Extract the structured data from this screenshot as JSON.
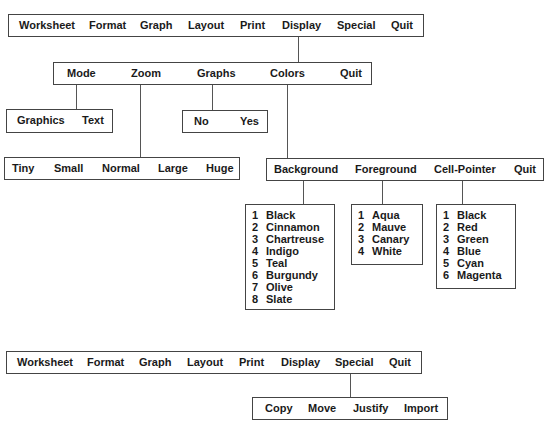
{
  "menus": {
    "main_top": {
      "items": [
        "Worksheet",
        "Format",
        "Graph",
        "Layout",
        "Print",
        "Display",
        "Special",
        "Quit"
      ]
    },
    "display": {
      "items": [
        "Mode",
        "Zoom",
        "Graphs",
        "Colors",
        "Quit"
      ]
    },
    "mode": {
      "items": [
        "Graphics",
        "Text"
      ]
    },
    "graphs": {
      "items": [
        "No",
        "Yes"
      ]
    },
    "zoom": {
      "items": [
        "Tiny",
        "Small",
        "Normal",
        "Large",
        "Huge"
      ]
    },
    "colors": {
      "items": [
        "Background",
        "Foreground",
        "Cell-Pointer",
        "Quit"
      ]
    },
    "background": {
      "items": [
        {
          "num": "1",
          "label": "Black"
        },
        {
          "num": "2",
          "label": "Cinnamon"
        },
        {
          "num": "3",
          "label": "Chartreuse"
        },
        {
          "num": "4",
          "label": "Indigo"
        },
        {
          "num": "5",
          "label": "Teal"
        },
        {
          "num": "6",
          "label": "Burgundy"
        },
        {
          "num": "7",
          "label": "Olive"
        },
        {
          "num": "8",
          "label": "Slate"
        }
      ]
    },
    "foreground": {
      "items": [
        {
          "num": "1",
          "label": "Aqua"
        },
        {
          "num": "2",
          "label": "Mauve"
        },
        {
          "num": "3",
          "label": "Canary"
        },
        {
          "num": "4",
          "label": "White"
        }
      ]
    },
    "cell_pointer": {
      "items": [
        {
          "num": "1",
          "label": "Black"
        },
        {
          "num": "2",
          "label": "Red"
        },
        {
          "num": "3",
          "label": "Green"
        },
        {
          "num": "4",
          "label": "Blue"
        },
        {
          "num": "5",
          "label": "Cyan"
        },
        {
          "num": "6",
          "label": "Magenta"
        }
      ]
    },
    "main_bottom": {
      "items": [
        "Worksheet",
        "Format",
        "Graph",
        "Layout",
        "Print",
        "Display",
        "Special",
        "Quit"
      ]
    },
    "special": {
      "items": [
        "Copy",
        "Move",
        "Justify",
        "Import"
      ]
    }
  }
}
